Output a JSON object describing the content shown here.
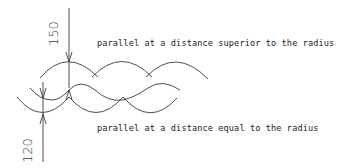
{
  "diagram": {
    "labels": {
      "superior": "parallel at a distance superior to the radius",
      "equal": "parallel at a distance equal to the radius"
    },
    "dimensions": {
      "top": "150",
      "bottom": "120"
    },
    "colors": {
      "stroke": "#333333",
      "text": "#222222",
      "background": "#ffffff"
    }
  }
}
